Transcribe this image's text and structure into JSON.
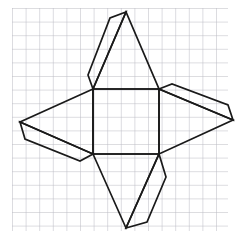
{
  "figure": {
    "canvas": {
      "width": 242,
      "height": 247,
      "background": "#ffffff"
    },
    "grid": {
      "visible": true,
      "color": "#b9b9c2",
      "line_width": 1,
      "spacing": 13.6,
      "x_start": 12,
      "x_end": 228,
      "y_start": 8,
      "y_end": 231,
      "columns": 16,
      "rows": 17
    },
    "stroke": {
      "color": "#1a1a1a",
      "width": 1.7,
      "fill": "none",
      "linejoin": "miter"
    },
    "shapes": [
      {
        "name": "central-square",
        "kind": "square",
        "points": "93,89 159,89 159,154 93,154"
      },
      {
        "name": "top-triangle-flap",
        "kind": "triangle",
        "points": "93,89 126,12 159,89"
      },
      {
        "name": "top-glue-tab",
        "kind": "thin-parallelogram",
        "points": "93,89 88,75 110,18 126,12"
      },
      {
        "name": "right-triangle-flap",
        "kind": "triangle",
        "points": "159,89 233,120 159,154"
      },
      {
        "name": "right-glue-tab",
        "kind": "thin-parallelogram",
        "points": "159,89 172,84 228,105 233,120"
      },
      {
        "name": "bottom-triangle-flap",
        "kind": "triangle",
        "points": "93,154 126,228 159,154"
      },
      {
        "name": "bottom-glue-tab",
        "kind": "thin-parallelogram",
        "points": "159,154 166,177 147,222 126,228"
      },
      {
        "name": "left-triangle-flap",
        "kind": "triangle",
        "points": "93,89 20,122 93,154"
      },
      {
        "name": "left-glue-tab",
        "kind": "thin-parallelogram",
        "points": "20,122 25,139 80,161 93,154"
      }
    ],
    "vertices": {
      "square_top_left": [
        93,
        89
      ],
      "square_top_right": [
        159,
        89
      ],
      "square_bottom_right": [
        159,
        154
      ],
      "square_bottom_left": [
        93,
        154
      ],
      "top_apex": [
        126,
        12
      ],
      "right_apex": [
        233,
        120
      ],
      "bottom_apex": [
        126,
        228
      ],
      "left_apex": [
        20,
        122
      ],
      "top_tab_outer": [
        110,
        18
      ],
      "top_tab_inner": [
        88,
        75
      ],
      "right_tab_inner": [
        172,
        84
      ],
      "right_tab_outer": [
        228,
        105
      ],
      "bottom_tab_inner": [
        166,
        177
      ],
      "bottom_tab_outer": [
        147,
        222
      ],
      "left_tab_outer": [
        25,
        139
      ],
      "left_tab_inner": [
        80,
        161
      ]
    }
  }
}
